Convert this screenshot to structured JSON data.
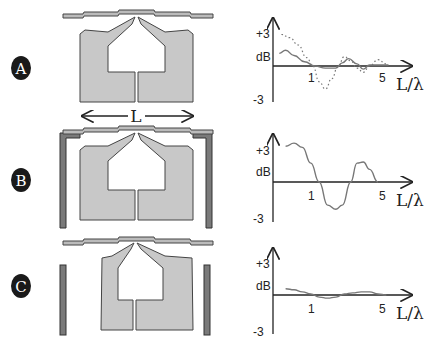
{
  "dimension_label": "L",
  "colors": {
    "antenna_fill": "#c8c8c8",
    "antenna_stroke": "#444444",
    "reflector_fill": "#7a7a7a",
    "badge_fill": "#1a1a1a",
    "curve": "#777777"
  },
  "panels": [
    {
      "id": "A",
      "badge": "A",
      "reflectors": "none",
      "plot": {
        "y_top_label": "+3",
        "y_unit_label": "dB",
        "y_bottom_label": "-3",
        "x_tick_1": "1",
        "x_tick_5": "5",
        "x_label": "L/λ"
      }
    },
    {
      "id": "B",
      "badge": "B",
      "reflectors": "bent-attached",
      "plot": {
        "y_top_label": "+3",
        "y_unit_label": "dB",
        "y_bottom_label": "-3",
        "x_tick_1": "1",
        "x_tick_5": "5",
        "x_label": "L/λ"
      }
    },
    {
      "id": "C",
      "badge": "C",
      "reflectors": "separate-vertical",
      "plot": {
        "y_top_label": "+3",
        "y_unit_label": "dB",
        "y_bottom_label": "-3",
        "x_tick_1": "1",
        "x_tick_5": "5",
        "x_label": "L/λ"
      }
    }
  ],
  "chart_data": [
    {
      "type": "line",
      "panel": "A",
      "xlabel": "L/λ",
      "ylabel": "dB",
      "ylim": [
        -3,
        3
      ],
      "xlim": [
        0,
        6
      ],
      "series": [
        {
          "name": "solid",
          "style": "solid",
          "x": [
            0.3,
            0.6,
            1.0,
            1.5,
            2.0,
            2.5,
            3.0,
            3.3,
            3.6,
            4.0,
            4.3,
            4.6,
            5.0,
            5.5
          ],
          "y": [
            1.2,
            1.5,
            1.0,
            0.4,
            0.0,
            -0.2,
            -0.2,
            0.3,
            0.7,
            0.2,
            -0.3,
            0.1,
            0.1,
            0.1
          ]
        },
        {
          "name": "dotted",
          "style": "dotted",
          "x": [
            0.4,
            0.8,
            1.2,
            1.6,
            1.9,
            2.2,
            2.5,
            2.8,
            3.1,
            3.4,
            3.7,
            4.0,
            4.3,
            4.6,
            5.0,
            5.4
          ],
          "y": [
            3.0,
            2.7,
            2.0,
            0.8,
            0.0,
            -1.5,
            -2.2,
            -1.2,
            0.0,
            0.9,
            0.5,
            -0.2,
            -0.6,
            0.0,
            0.6,
            0.2
          ]
        }
      ]
    },
    {
      "type": "line",
      "panel": "B",
      "xlabel": "L/λ",
      "ylabel": "dB",
      "ylim": [
        -3,
        3
      ],
      "xlim": [
        0,
        6
      ],
      "series": [
        {
          "name": "solid",
          "style": "solid",
          "x": [
            0.6,
            1.0,
            1.4,
            1.8,
            2.2,
            2.6,
            3.0,
            3.3,
            3.7,
            4.0,
            4.3,
            4.6,
            5.0
          ],
          "y": [
            3.4,
            3.7,
            3.3,
            1.8,
            0.0,
            -2.2,
            -2.6,
            -2.2,
            0.0,
            1.8,
            1.9,
            1.2,
            0.0
          ]
        }
      ]
    },
    {
      "type": "line",
      "panel": "C",
      "xlabel": "L/λ",
      "ylabel": "dB",
      "ylim": [
        -3,
        3
      ],
      "xlim": [
        0,
        6
      ],
      "series": [
        {
          "name": "solid",
          "style": "solid",
          "x": [
            0.6,
            1.0,
            1.4,
            1.8,
            2.2,
            2.6,
            3.0,
            3.4,
            3.8,
            4.2,
            4.6,
            5.0,
            5.4
          ],
          "y": [
            0.6,
            0.5,
            0.3,
            0.1,
            -0.2,
            -0.3,
            -0.2,
            0.1,
            0.2,
            0.3,
            0.3,
            0.1,
            0.0
          ]
        }
      ]
    }
  ]
}
